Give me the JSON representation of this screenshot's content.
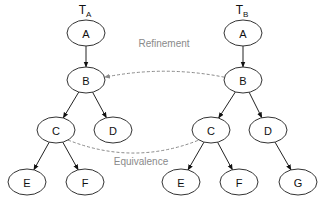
{
  "diagram": {
    "trees": [
      {
        "id": "TA",
        "title_main": "T",
        "title_sub": "A",
        "title_pos": [
          85,
          14
        ],
        "nodes": [
          {
            "id": "A",
            "label": "A",
            "cx": 86,
            "cy": 33
          },
          {
            "id": "B",
            "label": "B",
            "cx": 86,
            "cy": 80
          },
          {
            "id": "C",
            "label": "C",
            "cx": 56,
            "cy": 130
          },
          {
            "id": "D",
            "label": "D",
            "cx": 113,
            "cy": 130
          },
          {
            "id": "E",
            "label": "E",
            "cx": 27,
            "cy": 182
          },
          {
            "id": "F",
            "label": "F",
            "cx": 85,
            "cy": 182
          }
        ],
        "edges": [
          [
            "A",
            "B"
          ],
          [
            "B",
            "C"
          ],
          [
            "B",
            "D"
          ],
          [
            "C",
            "E"
          ],
          [
            "C",
            "F"
          ]
        ]
      },
      {
        "id": "TB",
        "title_main": "T",
        "title_sub": "B",
        "title_pos": [
          242,
          14
        ],
        "nodes": [
          {
            "id": "A",
            "label": "A",
            "cx": 243,
            "cy": 33
          },
          {
            "id": "B",
            "label": "B",
            "cx": 243,
            "cy": 80
          },
          {
            "id": "C",
            "label": "C",
            "cx": 211,
            "cy": 130
          },
          {
            "id": "D",
            "label": "D",
            "cx": 268,
            "cy": 130
          },
          {
            "id": "E",
            "label": "E",
            "cx": 181,
            "cy": 182
          },
          {
            "id": "F",
            "label": "F",
            "cx": 239,
            "cy": 182
          },
          {
            "id": "G",
            "label": "G",
            "cx": 298,
            "cy": 182
          }
        ],
        "edges": [
          [
            "A",
            "B"
          ],
          [
            "B",
            "C"
          ],
          [
            "B",
            "D"
          ],
          [
            "C",
            "E"
          ],
          [
            "C",
            "F"
          ],
          [
            "D",
            "G"
          ]
        ]
      }
    ],
    "node_rx": 19,
    "node_ry": 13,
    "relations": [
      {
        "id": "refinement",
        "label": "Refinement",
        "from": "TB.B",
        "to": "TA.B",
        "arrow": true,
        "label_pos": [
          164,
          47
        ]
      },
      {
        "id": "equivalence",
        "label": "Equivalence",
        "from": "TA.C",
        "to": "TB.C",
        "arrow": false,
        "label_pos": [
          141,
          165
        ]
      }
    ],
    "colors": {
      "node_stroke": "#333333",
      "edge": "#222222",
      "relation": "#8a8a8a"
    }
  }
}
